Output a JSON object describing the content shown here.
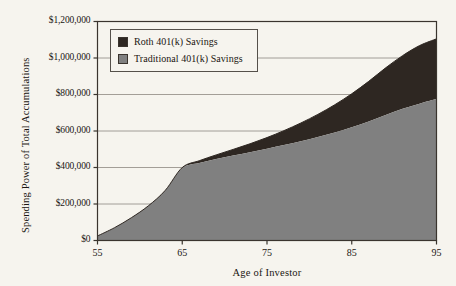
{
  "chart_data": {
    "type": "area",
    "title": "",
    "xlabel": "Age of Investor",
    "ylabel": "Spending Power of Total Accumulations",
    "xlim": [
      55,
      95
    ],
    "ylim": [
      0,
      1200000
    ],
    "grid": true,
    "stacked": true,
    "legend_position": "top-left-inside",
    "x_ticks": [
      "55",
      "65",
      "75",
      "85",
      "95"
    ],
    "x_tick_values": [
      55,
      65,
      75,
      85,
      95
    ],
    "y_ticks": [
      "$0",
      "$200,000",
      "$400,000",
      "$600,000",
      "$800,000",
      "$1,000,000",
      "$1,200,000"
    ],
    "y_tick_values": [
      0,
      200000,
      400000,
      600000,
      800000,
      1000000,
      1200000
    ],
    "x": [
      55,
      57,
      59,
      61,
      63,
      65,
      67,
      69,
      71,
      73,
      75,
      77,
      79,
      81,
      83,
      85,
      87,
      89,
      91,
      93,
      95
    ],
    "series": [
      {
        "name": "Traditional 401(k) Savings",
        "color": "#808080",
        "values": [
          25000,
          70000,
          125000,
          190000,
          275000,
          397000,
          425000,
          447000,
          466000,
          484000,
          503000,
          523000,
          544000,
          567000,
          592000,
          620000,
          652000,
          688000,
          722000,
          750000,
          775000
        ]
      },
      {
        "name": "Roth 401(k) Savings",
        "color": "#2e2722",
        "values": [
          0,
          0,
          0,
          0,
          0,
          3000,
          12000,
          22000,
          33000,
          46000,
          61000,
          79000,
          100000,
          124000,
          152000,
          184000,
          220000,
          258000,
          291000,
          318000,
          330000
        ]
      }
    ],
    "totals": [
      25000,
      70000,
      125000,
      190000,
      275000,
      400000,
      437000,
      469000,
      499000,
      530000,
      564000,
      602000,
      644000,
      691000,
      744000,
      804000,
      872000,
      946000,
      1013000,
      1068000,
      1105000
    ]
  },
  "legend": {
    "items": [
      {
        "label": "Roth 401(k) Savings",
        "color": "#2e2722"
      },
      {
        "label": "Traditional 401(k) Savings",
        "color": "#808080"
      }
    ]
  },
  "axes": {
    "y_title": "Spending Power of Total Accumulations",
    "x_title": "Age of Investor"
  },
  "colors": {
    "background": "#f6f4ee",
    "axis": "#3a342e",
    "grid": "#8e8880",
    "roth": "#2e2722",
    "traditional": "#808080"
  }
}
